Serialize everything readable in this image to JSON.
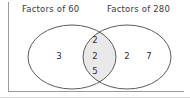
{
  "diagram": {
    "type": "venn-two-set",
    "title_left": "Factors of 60",
    "title_right": "Factors of 280",
    "left_only": [
      "3"
    ],
    "intersection": [
      "2",
      "2",
      "5"
    ],
    "right_only": [
      "2",
      "7"
    ],
    "colors": {
      "outline": "#4a4a4a",
      "intersection_fill": "#e9e9e9",
      "text": "#2e2e2e",
      "frame": "#9a9a9a",
      "background": "#ffffff"
    }
  }
}
